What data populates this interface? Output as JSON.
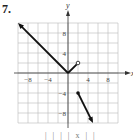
{
  "problem_number": "7.",
  "caption": "| | |  | x |   |",
  "chart_data": {
    "type": "line",
    "title": "",
    "xlabel": "x",
    "ylabel": "y",
    "xlim": [
      -10,
      10
    ],
    "ylim": [
      -10,
      10
    ],
    "grid": true,
    "grid_step": 2,
    "xticks": [
      -8,
      -4,
      4,
      8
    ],
    "yticks": [
      8,
      4,
      -4,
      -8
    ],
    "xtick_labels": [
      "−8",
      "−4",
      "4",
      "8"
    ],
    "ytick_labels": [
      "8",
      "4",
      "−4",
      "−8"
    ],
    "series": [
      {
        "name": "piece-1",
        "points": [
          [
            0,
            0
          ],
          [
            -10,
            10
          ]
        ],
        "start": "none",
        "end": "arrow"
      },
      {
        "name": "piece-2",
        "points": [
          [
            0,
            0
          ],
          [
            2,
            2
          ]
        ],
        "start": "none",
        "end": "open"
      },
      {
        "name": "piece-3",
        "points": [
          [
            2,
            -4
          ],
          [
            5,
            -10
          ]
        ],
        "start": "closed",
        "end": "arrow"
      }
    ],
    "color": "#111111"
  }
}
